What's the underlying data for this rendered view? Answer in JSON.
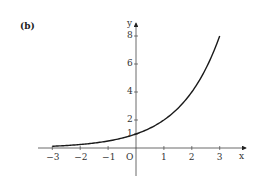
{
  "panel_label": "(b)",
  "chart_data": {
    "type": "line",
    "title": "",
    "xlabel": "x",
    "ylabel": "y",
    "origin_label": "O",
    "function": "y = 2^x",
    "x": [
      -3,
      -2,
      -1,
      0,
      1,
      2,
      3
    ],
    "series": [
      {
        "name": "y = 2^x",
        "values": [
          0.125,
          0.25,
          0.5,
          1,
          2,
          4,
          8
        ]
      }
    ],
    "xticks": [
      "−3",
      "−2",
      "−1",
      "1",
      "2",
      "3"
    ],
    "yticks": [
      "1",
      "2",
      "4",
      "6",
      "8"
    ],
    "xlim": [
      -3.6,
      3.6
    ],
    "ylim": [
      -1,
      8.5
    ],
    "grid": false,
    "legend": "none",
    "line_color": "#1a1a1a",
    "axis_color": "#444444"
  }
}
